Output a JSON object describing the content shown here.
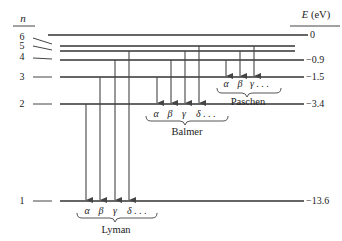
{
  "diagram": {
    "left_axis_label": "n",
    "right_axis_label": "E (eV)",
    "levels": [
      {
        "n": "6",
        "energy": "0"
      },
      {
        "n": "5",
        "energy": ""
      },
      {
        "n": "4",
        "energy": "−0.9"
      },
      {
        "n": "3",
        "energy": "−1.5"
      },
      {
        "n": "2",
        "energy": "−3.4"
      },
      {
        "n": "1",
        "energy": "−13.6"
      }
    ],
    "series": [
      {
        "name": "Lyman",
        "lines": [
          "α",
          "β",
          "γ",
          "δ . . ."
        ],
        "final_level": 1
      },
      {
        "name": "Balmer",
        "lines": [
          "α",
          "β",
          "γ",
          "δ . . ."
        ],
        "final_level": 2
      },
      {
        "name": "Paschen",
        "lines": [
          "α",
          "β",
          "γ . . ."
        ],
        "final_level": 3
      }
    ]
  }
}
